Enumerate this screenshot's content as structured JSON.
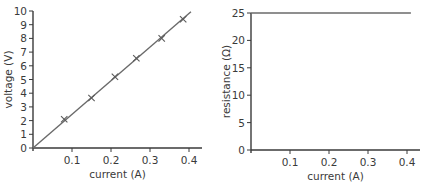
{
  "chart_data": [
    {
      "type": "line",
      "title": "",
      "xlabel": "current (A)",
      "ylabel": "voltage (V)",
      "xlim": [
        0,
        0.42
      ],
      "ylim": [
        0,
        10
      ],
      "xticks": [
        0.1,
        0.2,
        0.3,
        0.4
      ],
      "xtick_labels": [
        "0.1",
        "0.2",
        "0.3",
        "0.4"
      ],
      "yticks": [
        0,
        1,
        2,
        3,
        4,
        5,
        6,
        7,
        8,
        9,
        10
      ],
      "ytick_labels": [
        "0",
        "1",
        "2",
        "3",
        "4",
        "5",
        "6",
        "7",
        "8",
        "9",
        "10"
      ],
      "grid": false,
      "series": [
        {
          "name": "measured points",
          "marker": "x",
          "x": [
            0.08,
            0.15,
            0.21,
            0.265,
            0.33,
            0.385
          ],
          "y": [
            2.1,
            3.65,
            5.2,
            6.55,
            8.0,
            9.4
          ]
        },
        {
          "name": "best-fit line",
          "marker": "none",
          "x": [
            0,
            0.405
          ],
          "y": [
            0,
            9.95
          ]
        }
      ]
    },
    {
      "type": "line",
      "title": "",
      "xlabel": "current (A)",
      "ylabel": "resistance (Ω)",
      "xlim": [
        0,
        0.43
      ],
      "ylim": [
        0,
        25
      ],
      "xticks": [
        0.1,
        0.2,
        0.3,
        0.4
      ],
      "xtick_labels": [
        "0.1",
        "0.2",
        "0.3",
        "0.4"
      ],
      "yticks": [
        0,
        5,
        10,
        15,
        20,
        25
      ],
      "ytick_labels": [
        "0",
        "5",
        "10",
        "15",
        "20",
        "25"
      ],
      "grid": false,
      "series": [
        {
          "name": "resistance",
          "marker": "none",
          "x": [
            0,
            0.41
          ],
          "y": [
            25,
            25
          ]
        }
      ]
    }
  ]
}
